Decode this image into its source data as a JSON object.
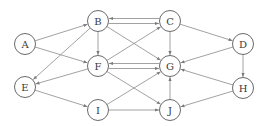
{
  "diagram": {
    "type": "directed-graph",
    "node_radius": 10.5,
    "colors": {
      "node_stroke": "#6a6a6a",
      "edge": "#8a8a8a",
      "label": "#3a3a3a",
      "background": "#ffffff"
    },
    "nodes": [
      {
        "id": "A",
        "label": "A",
        "x": 25,
        "y": 44
      },
      {
        "id": "B",
        "label": "B",
        "x": 98,
        "y": 21
      },
      {
        "id": "C",
        "label": "C",
        "x": 170,
        "y": 21
      },
      {
        "id": "D",
        "label": "D",
        "x": 243,
        "y": 44
      },
      {
        "id": "E",
        "label": "E",
        "x": 25,
        "y": 87
      },
      {
        "id": "F",
        "label": "F",
        "x": 98,
        "y": 66
      },
      {
        "id": "G",
        "label": "G",
        "x": 170,
        "y": 66
      },
      {
        "id": "H",
        "label": "H",
        "x": 243,
        "y": 88
      },
      {
        "id": "I",
        "label": "I",
        "x": 98,
        "y": 110
      },
      {
        "id": "J",
        "label": "J",
        "x": 170,
        "y": 110
      }
    ],
    "edges": [
      {
        "from": "A",
        "to": "B"
      },
      {
        "from": "A",
        "to": "F"
      },
      {
        "from": "B",
        "to": "C",
        "offset": 2.5
      },
      {
        "from": "C",
        "to": "B",
        "offset": 2.5
      },
      {
        "from": "B",
        "to": "F"
      },
      {
        "from": "B",
        "to": "G"
      },
      {
        "from": "B",
        "to": "E"
      },
      {
        "from": "C",
        "to": "D"
      },
      {
        "from": "C",
        "to": "G"
      },
      {
        "from": "F",
        "to": "C"
      },
      {
        "from": "F",
        "to": "G",
        "offset": 2.5
      },
      {
        "from": "G",
        "to": "F",
        "offset": 2.5
      },
      {
        "from": "F",
        "to": "E"
      },
      {
        "from": "F",
        "to": "J"
      },
      {
        "from": "D",
        "to": "G"
      },
      {
        "from": "D",
        "to": "H"
      },
      {
        "from": "H",
        "to": "G"
      },
      {
        "from": "H",
        "to": "J"
      },
      {
        "from": "E",
        "to": "I"
      },
      {
        "from": "I",
        "to": "G"
      },
      {
        "from": "I",
        "to": "J"
      },
      {
        "from": "J",
        "to": "G"
      }
    ]
  }
}
